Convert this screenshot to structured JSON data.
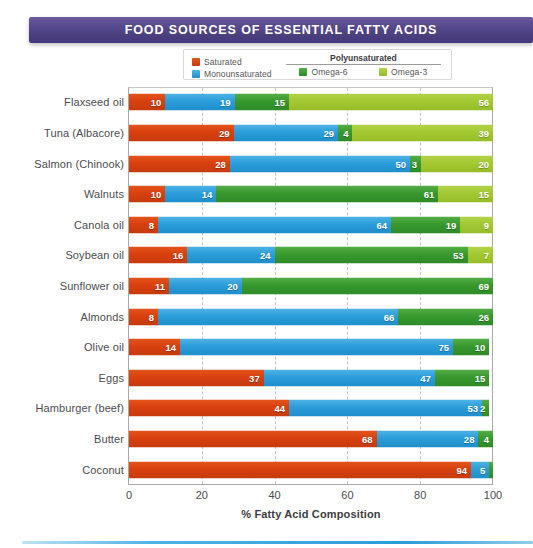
{
  "title": "FOOD SOURCES OF ESSENTIAL FATTY ACIDS",
  "legend": {
    "saturated_label": "Saturated",
    "monounsaturated_label": "Monounsaturated",
    "poly_title": "Polyunsaturated",
    "omega6_label": "Omega-6",
    "omega3_label": "Omega-3"
  },
  "colors": {
    "title_banner": "#4b3f7e",
    "saturated": "#d8400f",
    "monounsaturated": "#2b9dd9",
    "omega6": "#38992f",
    "omega3": "#a3c832",
    "bottom_rule": "#2b9dd9",
    "axis": "#a9a9a9",
    "gridline": "#c3c3c3",
    "label_text": "#4c4c4f"
  },
  "chart_data": {
    "type": "bar",
    "subtype": "stacked-horizontal",
    "title": "FOOD SOURCES OF ESSENTIAL FATTY ACIDS",
    "xlabel": "% Fatty Acid Composition",
    "ylabel": "",
    "xlim": [
      0,
      100
    ],
    "xticks": [
      0,
      20,
      40,
      60,
      80,
      100
    ],
    "grid": "vertical-dashed",
    "legend_position": "top-center",
    "categories": [
      "Flaxseed oil",
      "Tuna (Albacore)",
      "Salmon (Chinook)",
      "Walnuts",
      "Canola oil",
      "Soybean oil",
      "Sunflower oil",
      "Almonds",
      "Olive oil",
      "Eggs",
      "Hamburger (beef)",
      "Butter",
      "Coconut"
    ],
    "series": [
      {
        "name": "Saturated",
        "color": "#d8400f",
        "values": [
          10,
          29,
          28,
          10,
          8,
          16,
          11,
          8,
          14,
          37,
          44,
          68,
          94
        ]
      },
      {
        "name": "Monounsaturated",
        "color": "#2b9dd9",
        "values": [
          19,
          29,
          50,
          14,
          64,
          24,
          20,
          66,
          75,
          47,
          53,
          28,
          5
        ]
      },
      {
        "name": "Omega-6",
        "color": "#38992f",
        "values": [
          15,
          4,
          3,
          61,
          19,
          53,
          69,
          26,
          10,
          15,
          2,
          4,
          1
        ]
      },
      {
        "name": "Omega-3",
        "color": "#a3c832",
        "values": [
          56,
          39,
          20,
          15,
          9,
          7,
          0,
          0,
          0,
          0,
          0,
          0,
          0
        ]
      }
    ],
    "rows": [
      {
        "label": "Flaxseed oil",
        "saturated": 10,
        "monounsaturated": 19,
        "omega6": 15,
        "omega3": 56
      },
      {
        "label": "Tuna (Albacore)",
        "saturated": 29,
        "monounsaturated": 29,
        "omega6": 4,
        "omega3": 39
      },
      {
        "label": "Salmon (Chinook)",
        "saturated": 28,
        "monounsaturated": 50,
        "omega6": 3,
        "omega3": 20
      },
      {
        "label": "Walnuts",
        "saturated": 10,
        "monounsaturated": 14,
        "omega6": 61,
        "omega3": 15
      },
      {
        "label": "Canola oil",
        "saturated": 8,
        "monounsaturated": 64,
        "omega6": 19,
        "omega3": 9
      },
      {
        "label": "Soybean oil",
        "saturated": 16,
        "monounsaturated": 24,
        "omega6": 53,
        "omega3": 7
      },
      {
        "label": "Sunflower oil",
        "saturated": 11,
        "monounsaturated": 20,
        "omega6": 69,
        "omega3": 0
      },
      {
        "label": "Almonds",
        "saturated": 8,
        "monounsaturated": 66,
        "omega6": 26,
        "omega3": 0
      },
      {
        "label": "Olive oil",
        "saturated": 14,
        "monounsaturated": 75,
        "omega6": 10,
        "omega3": 0
      },
      {
        "label": "Eggs",
        "saturated": 37,
        "monounsaturated": 47,
        "omega6": 15,
        "omega3": 0
      },
      {
        "label": "Hamburger (beef)",
        "saturated": 44,
        "monounsaturated": 53,
        "omega6": 2,
        "omega3": 0
      },
      {
        "label": "Butter",
        "saturated": 68,
        "monounsaturated": 28,
        "omega6": 4,
        "omega3": 0
      },
      {
        "label": "Coconut",
        "saturated": 94,
        "monounsaturated": 5,
        "omega6": 1,
        "omega3": 0
      }
    ]
  },
  "axis": {
    "x_title": "% Fatty Acid Composition",
    "ticks": [
      "0",
      "20",
      "40",
      "60",
      "80",
      "100"
    ]
  }
}
